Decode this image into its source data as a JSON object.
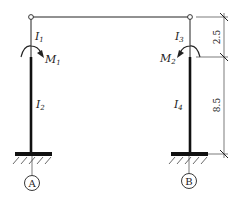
{
  "diagram": {
    "type": "portal-frame",
    "beam": {
      "hinged_ends": true
    },
    "columns": [
      {
        "id": "left",
        "support_label": "A",
        "upper_segment": {
          "inertia_label": "I",
          "inertia_sub": "1"
        },
        "lower_segment": {
          "inertia_label": "I",
          "inertia_sub": "2"
        },
        "moment": {
          "label": "M",
          "sub": "1",
          "direction": "clockwise"
        }
      },
      {
        "id": "right",
        "support_label": "B",
        "upper_segment": {
          "inertia_label": "I",
          "inertia_sub": "3"
        },
        "lower_segment": {
          "inertia_label": "I",
          "inertia_sub": "4"
        },
        "moment": {
          "label": "M",
          "sub": "2",
          "direction": "counterclockwise"
        }
      }
    ],
    "dimensions": {
      "upper": "2.5",
      "lower": "8.5"
    }
  }
}
